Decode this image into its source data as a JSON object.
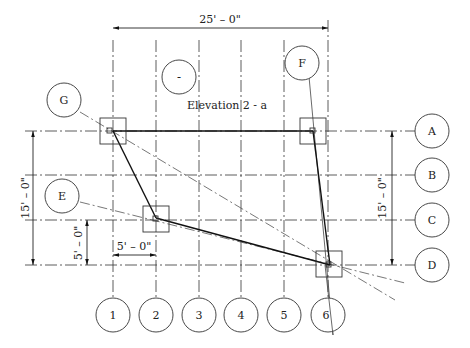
{
  "title": "Elevation 2 - a",
  "title_bubble": "-",
  "dimensions": {
    "overall_width": "25' – 0\"",
    "left_height": "15' – 0\"",
    "right_height": "15' – 0\"",
    "small_vertical": "5' – 0\"",
    "small_horizontal": "5' – 0\""
  },
  "grid": {
    "columns": [
      "1",
      "2",
      "3",
      "4",
      "5",
      "6"
    ],
    "rows": [
      "A",
      "B",
      "C",
      "D"
    ]
  },
  "tags": {
    "G": "G",
    "E": "E",
    "F": "F"
  }
}
